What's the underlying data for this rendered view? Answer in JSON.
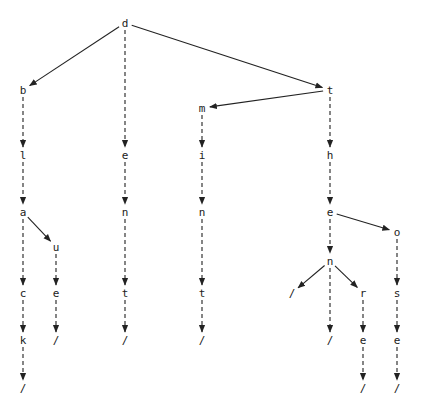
{
  "diagram": {
    "type": "trie",
    "colors": {
      "line": "#222222",
      "text": "#222222",
      "background": "#ffffff"
    },
    "words": [
      "black",
      "blue",
      "dent",
      "mint",
      "then",
      "there",
      "those"
    ],
    "nodes": [
      {
        "id": "n_d",
        "label": "d",
        "x": 125,
        "y": 23
      },
      {
        "id": "n_b",
        "label": "b",
        "x": 23,
        "y": 90
      },
      {
        "id": "n_t1",
        "label": "t",
        "x": 330,
        "y": 90
      },
      {
        "id": "n_m",
        "label": "m",
        "x": 202,
        "y": 108
      },
      {
        "id": "n_l",
        "label": "l",
        "x": 23,
        "y": 155
      },
      {
        "id": "n_e1",
        "label": "e",
        "x": 125,
        "y": 155
      },
      {
        "id": "n_i",
        "label": "i",
        "x": 202,
        "y": 155
      },
      {
        "id": "n_h",
        "label": "h",
        "x": 330,
        "y": 155
      },
      {
        "id": "n_a",
        "label": "a",
        "x": 23,
        "y": 212
      },
      {
        "id": "n_n1",
        "label": "n",
        "x": 125,
        "y": 212
      },
      {
        "id": "n_n2",
        "label": "n",
        "x": 202,
        "y": 212
      },
      {
        "id": "n_e2",
        "label": "e",
        "x": 330,
        "y": 212
      },
      {
        "id": "n_u",
        "label": "u",
        "x": 56,
        "y": 247
      },
      {
        "id": "n_o",
        "label": "o",
        "x": 397,
        "y": 232
      },
      {
        "id": "n_n3",
        "label": "n",
        "x": 330,
        "y": 261
      },
      {
        "id": "n_s1",
        "label": "/",
        "x": 292,
        "y": 293
      },
      {
        "id": "n_c",
        "label": "c",
        "x": 23,
        "y": 293
      },
      {
        "id": "n_e3",
        "label": "e",
        "x": 56,
        "y": 293
      },
      {
        "id": "n_t2",
        "label": "t",
        "x": 125,
        "y": 293
      },
      {
        "id": "n_t3",
        "label": "t",
        "x": 202,
        "y": 293
      },
      {
        "id": "n_r",
        "label": "r",
        "x": 363,
        "y": 293
      },
      {
        "id": "n_s",
        "label": "s",
        "x": 397,
        "y": 293
      },
      {
        "id": "n_k",
        "label": "k",
        "x": 23,
        "y": 340
      },
      {
        "id": "n_s2",
        "label": "/",
        "x": 56,
        "y": 340
      },
      {
        "id": "n_s3",
        "label": "/",
        "x": 125,
        "y": 340
      },
      {
        "id": "n_s4",
        "label": "/",
        "x": 202,
        "y": 340
      },
      {
        "id": "n_s5",
        "label": "/",
        "x": 330,
        "y": 340
      },
      {
        "id": "n_e4",
        "label": "e",
        "x": 363,
        "y": 340
      },
      {
        "id": "n_e5",
        "label": "e",
        "x": 397,
        "y": 340
      },
      {
        "id": "n_s6",
        "label": "/",
        "x": 23,
        "y": 388
      },
      {
        "id": "n_s7",
        "label": "/",
        "x": 363,
        "y": 388
      },
      {
        "id": "n_s8",
        "label": "/",
        "x": 397,
        "y": 388
      }
    ],
    "edges": [
      {
        "from": "n_d",
        "to": "n_b",
        "style": "solid"
      },
      {
        "from": "n_d",
        "to": "n_t1",
        "style": "solid"
      },
      {
        "from": "n_d",
        "to": "n_e1",
        "style": "dashed"
      },
      {
        "from": "n_t1",
        "to": "n_m",
        "style": "solid"
      },
      {
        "from": "n_t1",
        "to": "n_h",
        "style": "dashed"
      },
      {
        "from": "n_b",
        "to": "n_l",
        "style": "dashed"
      },
      {
        "from": "n_m",
        "to": "n_i",
        "style": "dashed"
      },
      {
        "from": "n_l",
        "to": "n_a",
        "style": "dashed"
      },
      {
        "from": "n_e1",
        "to": "n_n1",
        "style": "dashed"
      },
      {
        "from": "n_i",
        "to": "n_n2",
        "style": "dashed"
      },
      {
        "from": "n_h",
        "to": "n_e2",
        "style": "dashed"
      },
      {
        "from": "n_a",
        "to": "n_u",
        "style": "solid"
      },
      {
        "from": "n_e2",
        "to": "n_o",
        "style": "solid"
      },
      {
        "from": "n_e2",
        "to": "n_n3",
        "style": "dashed"
      },
      {
        "from": "n_n3",
        "to": "n_s1",
        "style": "solid"
      },
      {
        "from": "n_n3",
        "to": "n_r",
        "style": "solid"
      },
      {
        "from": "n_a",
        "to": "n_c",
        "style": "dashed"
      },
      {
        "from": "n_u",
        "to": "n_e3",
        "style": "dashed"
      },
      {
        "from": "n_n1",
        "to": "n_t2",
        "style": "dashed"
      },
      {
        "from": "n_n2",
        "to": "n_t3",
        "style": "dashed"
      },
      {
        "from": "n_o",
        "to": "n_s",
        "style": "dashed"
      },
      {
        "from": "n_c",
        "to": "n_k",
        "style": "dashed"
      },
      {
        "from": "n_e3",
        "to": "n_s2",
        "style": "dashed"
      },
      {
        "from": "n_t2",
        "to": "n_s3",
        "style": "dashed"
      },
      {
        "from": "n_t3",
        "to": "n_s4",
        "style": "dashed"
      },
      {
        "from": "n_n3",
        "to": "n_s5",
        "style": "dashed"
      },
      {
        "from": "n_r",
        "to": "n_e4",
        "style": "dashed"
      },
      {
        "from": "n_s",
        "to": "n_e5",
        "style": "dashed"
      },
      {
        "from": "n_k",
        "to": "n_s6",
        "style": "dashed"
      },
      {
        "from": "n_e4",
        "to": "n_s7",
        "style": "dashed"
      },
      {
        "from": "n_e5",
        "to": "n_s8",
        "style": "dashed"
      }
    ]
  }
}
